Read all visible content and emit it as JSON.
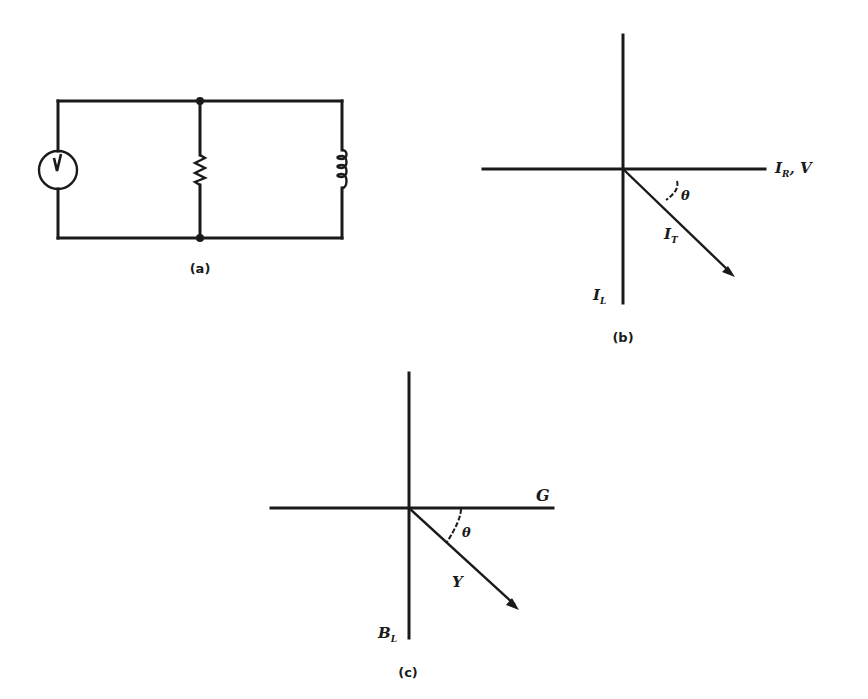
{
  "figure": {
    "panels": [
      {
        "id": "a",
        "caption": "(a)",
        "type": "circuit",
        "description": "Parallel RL circuit",
        "components": [
          {
            "kind": "ac-voltage-source",
            "label": "V"
          },
          {
            "kind": "resistor",
            "label": ""
          },
          {
            "kind": "inductor",
            "label": ""
          }
        ]
      },
      {
        "id": "b",
        "caption": "(b)",
        "type": "phasor-diagram",
        "horizontal_axis_label": {
          "main": "I",
          "sub": "R",
          "suffix": ", V"
        },
        "vertical_axis_label": {
          "main": "I",
          "sub": "L"
        },
        "vector_label": {
          "main": "I",
          "sub": "T"
        },
        "angle_label": "θ"
      },
      {
        "id": "c",
        "caption": "(c)",
        "type": "admittance-diagram",
        "horizontal_axis_label": {
          "main": "G"
        },
        "vertical_axis_label": {
          "main": "B",
          "sub": "L"
        },
        "vector_label": {
          "main": "Y"
        },
        "angle_label": "θ"
      }
    ],
    "source_symbol_label": "V"
  }
}
